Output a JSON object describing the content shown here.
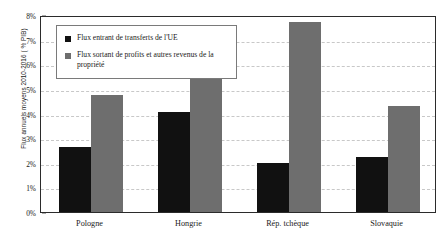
{
  "chart_data": {
    "type": "bar",
    "title": "",
    "subtitle": "",
    "xlabel": "",
    "ylabel": "Flux annuels moyens 2010-2016 ( % PIB)",
    "categories": [
      "Pologne",
      "Hongrie",
      "Rép. tchèque",
      "Slovaquie"
    ],
    "series": [
      {
        "name": "Flux entrant de transferts de l'UE",
        "color": "#111111",
        "values": [
          2.65,
          4.05,
          2.0,
          2.25
        ]
      },
      {
        "name": "Flux sortant de profits et autres revenus de la propriété",
        "color": "#6e6e6e",
        "values": [
          4.75,
          7.25,
          7.7,
          4.3
        ]
      }
    ],
    "ylim": [
      0,
      8
    ],
    "ytick_step": 1,
    "ytick_labels": [
      "0%",
      "1%",
      "2%",
      "3%",
      "4%",
      "5%",
      "6%",
      "7%",
      "8%"
    ],
    "grid": true,
    "grid_style": "dashed",
    "grid_color": "#c8c8c8",
    "legend_position": "top-left-inside",
    "axis_color": "#2b2b2b",
    "background": "#ffffff"
  },
  "legend": {
    "items": [
      {
        "label": "Flux entrant de transferts de l'UE",
        "color": "#111111"
      },
      {
        "label": "Flux sortant de profits et autres revenus de la propriété",
        "color": "#6e6e6e"
      }
    ]
  }
}
